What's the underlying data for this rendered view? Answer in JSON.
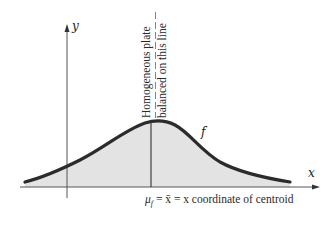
{
  "figure": {
    "y_axis_label": "y",
    "x_axis_label": "x",
    "curve_label": "f",
    "annotation_line1": "Homogeneous plate",
    "annotation_line2": "balanced on this line",
    "caption_mu": "μ",
    "caption_mu_sub": "f",
    "caption_rest": " = x̄ = x coordinate of centroid",
    "colors": {
      "curve": "#2b2b2b",
      "fill": "#e3e3e3",
      "axes": "#555555",
      "text": "#2a2a2a"
    }
  }
}
